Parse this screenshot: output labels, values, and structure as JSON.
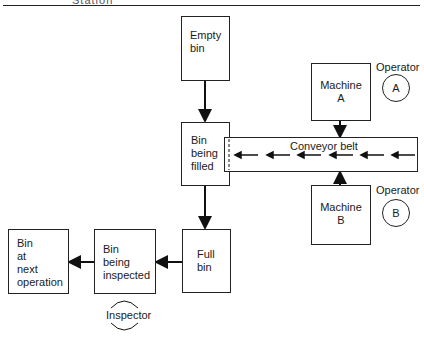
{
  "header": {
    "partial_text": "Station"
  },
  "diagram": {
    "nodes": {
      "empty_bin": "Empty\nbin",
      "bin_being_filled": "Bin\nbeing\nfilled",
      "full_bin": "Full\nbin",
      "bin_being_inspected": "Bin\nbeing\ninspected",
      "bin_at_next_operation": "Bin\nat\nnext\noperation",
      "machine_a": "Machine\nA",
      "machine_b": "Machine\nB",
      "conveyor_belt": "Conveyor belt"
    },
    "operators": {
      "a": {
        "label": "Operator",
        "symbol": "A"
      },
      "b": {
        "label": "Operator",
        "symbol": "B"
      }
    },
    "inspector": {
      "label": "Inspector"
    },
    "edges": [
      {
        "from": "empty_bin",
        "to": "bin_being_filled"
      },
      {
        "from": "machine_a",
        "to": "conveyor_belt"
      },
      {
        "from": "machine_b",
        "to": "conveyor_belt"
      },
      {
        "from": "conveyor_belt",
        "to": "bin_being_filled"
      },
      {
        "from": "bin_being_filled",
        "to": "full_bin"
      },
      {
        "from": "full_bin",
        "to": "bin_being_inspected"
      },
      {
        "from": "bin_being_inspected",
        "to": "bin_at_next_operation"
      }
    ],
    "conveyor_arrow_count": 6
  }
}
